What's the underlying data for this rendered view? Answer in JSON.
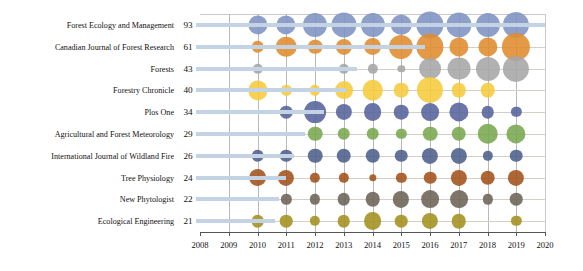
{
  "chart_data": {
    "type": "scatter",
    "title": "",
    "subtitle": "",
    "xlabel": "",
    "ylabel": "",
    "xlim": [
      2008,
      2020
    ],
    "ylim_categories_top_to_bottom": true,
    "grid": true,
    "legend": "none",
    "x_ticks": [
      "2008",
      "2009",
      "2010",
      "2011",
      "2012",
      "2013",
      "2014",
      "2015",
      "2016",
      "2017",
      "2018",
      "2019",
      "2020"
    ],
    "years": [
      2010,
      2011,
      2012,
      2013,
      2014,
      2015,
      2016,
      2017,
      2018,
      2019
    ],
    "categories": [
      "Forest Ecology and Management",
      "Canadian Journal of Forest Research",
      "Forests",
      "Forestry Chronicle",
      "Plos One",
      "Agricultural and Forest Meteorology",
      "International Journal of Wildland Fire",
      "Tree Physiology",
      "New Phytologist",
      "Ecological Engineering"
    ],
    "totals": [
      93,
      61,
      43,
      40,
      34,
      29,
      26,
      24,
      22,
      21
    ],
    "colors": [
      "#7e93c1",
      "#e08b2d",
      "#a6a6a6",
      "#f5cb3c",
      "#55639b",
      "#79a74e",
      "#4d5f8b",
      "#a2511a",
      "#6d6357",
      "#a3911f"
    ],
    "series": [
      {
        "name": "Forest Ecology and Management",
        "color": "#7e93c1",
        "total": 93,
        "values": [
          7,
          7,
          11,
          12,
          11,
          8,
          14,
          12,
          11,
          13
        ]
      },
      {
        "name": "Canadian Journal of Forest Research",
        "color": "#e08b2d",
        "total": 61,
        "values": [
          3,
          8,
          4,
          5,
          6,
          11,
          14,
          7,
          7,
          15
        ]
      },
      {
        "name": "Forests",
        "color": "#a6a6a6",
        "total": 43,
        "values": [
          2,
          0,
          0,
          2,
          2,
          1,
          9,
          10,
          11,
          13
        ]
      },
      {
        "name": "Forestry Chronicle",
        "color": "#f5cb3c",
        "total": 40,
        "values": [
          7,
          2,
          2,
          6,
          8,
          4,
          13,
          4,
          4,
          0
        ]
      },
      {
        "name": "Plos One",
        "color": "#55639b",
        "total": 34,
        "values": [
          0,
          3,
          9,
          5,
          6,
          4,
          6,
          7,
          3,
          2
        ]
      },
      {
        "name": "Agricultural and Forest Meteorology",
        "color": "#79a74e",
        "total": 29,
        "values": [
          0,
          0,
          4,
          3,
          3,
          2,
          4,
          4,
          8,
          7
        ]
      },
      {
        "name": "International Journal of Wildland Fire",
        "color": "#4d5f8b",
        "total": 26,
        "values": [
          3,
          3,
          4,
          4,
          4,
          3,
          5,
          5,
          2,
          3
        ]
      },
      {
        "name": "Tree Physiology",
        "color": "#a2511a",
        "total": 24,
        "values": [
          6,
          5,
          2,
          2,
          1,
          2,
          3,
          5,
          4,
          5
        ]
      },
      {
        "name": "New Phytologist",
        "color": "#6d6357",
        "total": 22,
        "values": [
          0,
          2,
          2,
          3,
          4,
          5,
          6,
          6,
          2,
          3
        ]
      },
      {
        "name": "Ecological Engineering",
        "color": "#a3911f",
        "total": 21,
        "values": [
          3,
          3,
          2,
          3,
          6,
          3,
          5,
          4,
          0,
          2
        ]
      }
    ]
  }
}
